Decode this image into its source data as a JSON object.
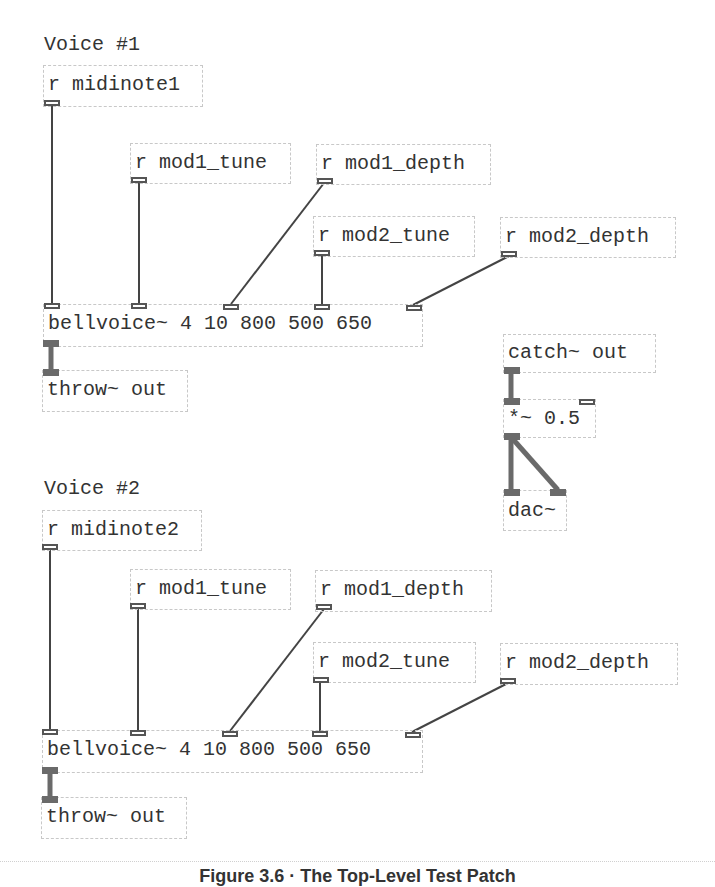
{
  "voices": [
    {
      "label": "Voice #1",
      "midinote": "r midinote1",
      "mod1_tune": "r mod1_tune",
      "mod1_depth": "r mod1_depth",
      "mod2_tune": "r mod2_tune",
      "mod2_depth": "r mod2_depth",
      "bellvoice": "bellvoice~ 4 10 800 500 650",
      "throw": "throw~ out"
    },
    {
      "label": "Voice #2",
      "midinote": "r midinote2",
      "mod1_tune": "r mod1_tune",
      "mod1_depth": "r mod1_depth",
      "mod2_tune": "r mod2_tune",
      "mod2_depth": "r mod2_depth",
      "bellvoice": "bellvoice~ 4 10 800 500 650",
      "throw": "throw~ out"
    }
  ],
  "output_chain": {
    "catch": "catch~ out",
    "gain": "*~ 0.5",
    "dac": "dac~"
  },
  "caption": "Figure 3.6 · The Top-Level Test Patch"
}
